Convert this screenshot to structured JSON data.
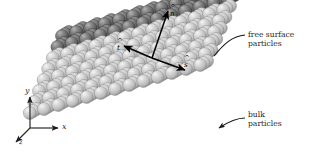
{
  "figure": {
    "kind": "particle-slab-schematic",
    "background_color": "#ffffff",
    "annotations": {
      "free_surface_label": "free surface\nparticles",
      "bulk_label": "bulk\nparticles"
    },
    "global_axes": {
      "x_label": "x",
      "y_label": "y",
      "z_label": "z",
      "origin_px": [
        30,
        128
      ]
    },
    "local_frame": {
      "normal_label": "n",
      "normal_hat": true,
      "tangent1_label": "t",
      "tangent1_hat": true,
      "tangent2_label": "s",
      "tangent2_hat": true
    },
    "colors": {
      "free_surface_particle": "#6e6e6e",
      "free_surface_particle_highlight": "#a9a9a9",
      "free_surface_particle_shadow": "#3a3a3a",
      "bulk_particle": "#bdbdbd",
      "bulk_particle_highlight": "#ededed",
      "bulk_particle_shadow": "#8a8a8a",
      "arrow_color": "#000000",
      "leader_color": "#111111",
      "text_color": "#1d1d1d"
    },
    "lattice": {
      "columns": 13,
      "rows_per_column": 8,
      "surface_rows": 2,
      "column_step_px": [
        14.2,
        -4.0
      ],
      "row_step_px": [
        -4.6,
        11.0
      ],
      "depth_step_px": [
        3.4,
        -2.0
      ],
      "depth_layers": 3,
      "sphere_diameter_px": 13.0,
      "origin_px": [
        62,
        36
      ]
    }
  }
}
